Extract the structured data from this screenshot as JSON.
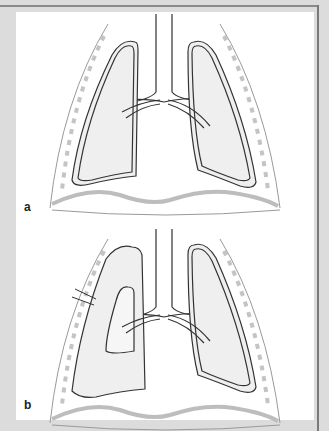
{
  "figure": {
    "colors": {
      "background": "#dcdcdc",
      "panel": "#ffffff",
      "lung_fill": "#efefef",
      "outline": "#333333",
      "rib_marks": "#c4c4c4",
      "diaphragm": "#bdbdbd"
    },
    "panels": [
      {
        "label": "a",
        "caption_meaning": "Normal lungs, both fully expanded"
      },
      {
        "label": "b",
        "caption_meaning": "Right lung collapsed with chest wall puncture"
      }
    ]
  }
}
